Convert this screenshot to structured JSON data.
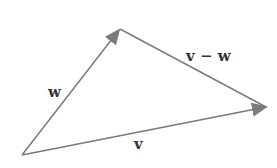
{
  "diagram": {
    "colors": {
      "line": "#7a7a7a",
      "text": "#333333"
    },
    "vectors": [
      {
        "name": "w",
        "label": "w",
        "from": [
          22,
          155
        ],
        "to": [
          120,
          29
        ]
      },
      {
        "name": "v",
        "label": "v",
        "from": [
          22,
          155
        ],
        "to": [
          266,
          107
        ]
      },
      {
        "name": "v-w",
        "label": "v − w",
        "from": [
          120,
          29
        ],
        "to": [
          266,
          107
        ]
      }
    ],
    "labels": {
      "w": "w",
      "v": "v",
      "v_minus_w": "v − w"
    }
  }
}
